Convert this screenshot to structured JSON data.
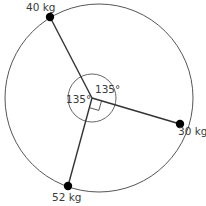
{
  "diagram": {
    "type": "force-diagram",
    "outer_circle": {
      "cx": 99,
      "cy": 98,
      "r": 94,
      "stroke": "#555555"
    },
    "hub": {
      "x": 92,
      "y": 98,
      "inner_circle_r": 24
    },
    "weights": [
      {
        "id": "w40",
        "label": "40 kg",
        "x": 50,
        "y": 17,
        "label_x": 28,
        "label_y": 11
      },
      {
        "id": "w30",
        "label": "30 kg",
        "x": 180,
        "y": 124,
        "label_x": 178,
        "label_y": 136
      },
      {
        "id": "w52",
        "label": "52 kg",
        "x": 68,
        "y": 186,
        "label_x": 52,
        "label_y": 201
      }
    ],
    "angles": [
      {
        "id": "a1",
        "label": "135°",
        "x": 98,
        "y": 93
      },
      {
        "id": "a2",
        "label": "135°",
        "x": 67,
        "y": 107
      }
    ],
    "right_angle_marker": true,
    "line_color": "#333333",
    "dot_color": "#000000"
  }
}
